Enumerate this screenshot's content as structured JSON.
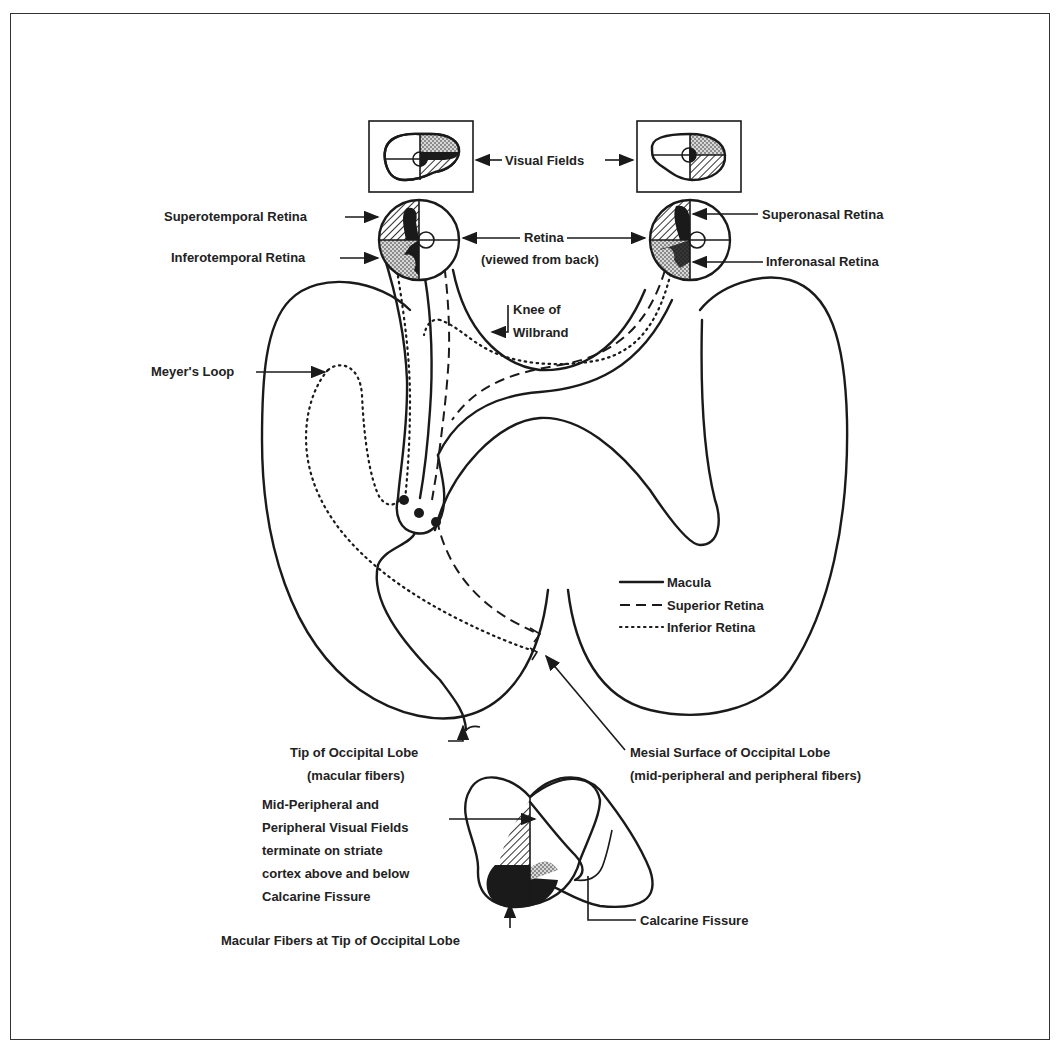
{
  "figure": {
    "labels": {
      "visual_fields": "Visual Fields",
      "superotemporal_retina": "Superotemporal Retina",
      "inferotemporal_retina": "Inferotemporal Retina",
      "retina": "Retina",
      "retina_sub": "(viewed from back)",
      "superonasal_retina": "Superonasal Retina",
      "inferonasal_retina": "Inferonasal Retina",
      "knee_line1": "Knee of",
      "knee_line2": "Wilbrand",
      "meyers_loop": "Meyer's Loop",
      "tip_occipital": "Tip of Occipital Lobe",
      "tip_occipital_sub": "(macular fibers)",
      "mesial_surface": "Mesial Surface of Occipital Lobe",
      "mesial_surface_sub": "(mid-peripheral and peripheral fibers)",
      "midperipheral_1": "Mid-Peripheral and",
      "midperipheral_2": "Peripheral Visual Fields",
      "midperipheral_3": "terminate on striate",
      "midperipheral_4": "cortex above and below",
      "midperipheral_5": "Calcarine Fissure",
      "macular_fibers_tip": "Macular Fibers at Tip of Occipital Lobe",
      "calcarine_fissure": "Calcarine Fissure"
    },
    "legend": [
      {
        "style": "solid",
        "label": "Macula"
      },
      {
        "style": "dashed",
        "label": "Superior Retina"
      },
      {
        "style": "dotted",
        "label": "Inferior Retina"
      }
    ],
    "colors": {
      "ink": "#1a1a1a",
      "background": "#ffffff",
      "stipple": "#9a9a9a",
      "hatch": "#555555"
    }
  }
}
